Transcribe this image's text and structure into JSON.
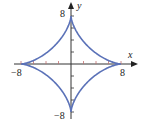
{
  "chart_data": {
    "type": "line",
    "title": "",
    "curve": "astroid x^(2/3) + y^(2/3) = 8^(2/3)",
    "xlabel": "x",
    "ylabel": "y",
    "xlim": [
      -8,
      8
    ],
    "ylim": [
      -8,
      8
    ],
    "x_tick_labels": [
      "-8",
      "8"
    ],
    "y_tick_labels": [
      "8",
      "-8"
    ],
    "tick_step": 2,
    "grid": false,
    "series": [
      {
        "name": "astroid",
        "color": "#5b72b8",
        "parametric": "x = 8cos^3(t), y = 8sin^3(t)",
        "cusps": [
          [
            8,
            0
          ],
          [
            0,
            8
          ],
          [
            -8,
            0
          ],
          [
            0,
            -8
          ]
        ]
      }
    ]
  },
  "labels": {
    "x_axis": "x",
    "y_axis": "y",
    "x_min": "−8",
    "x_max": "8",
    "y_max": "8",
    "y_min": "−8"
  },
  "colors": {
    "curve": "#5b72b8",
    "axis": "#333333",
    "tick": "#c07070"
  }
}
